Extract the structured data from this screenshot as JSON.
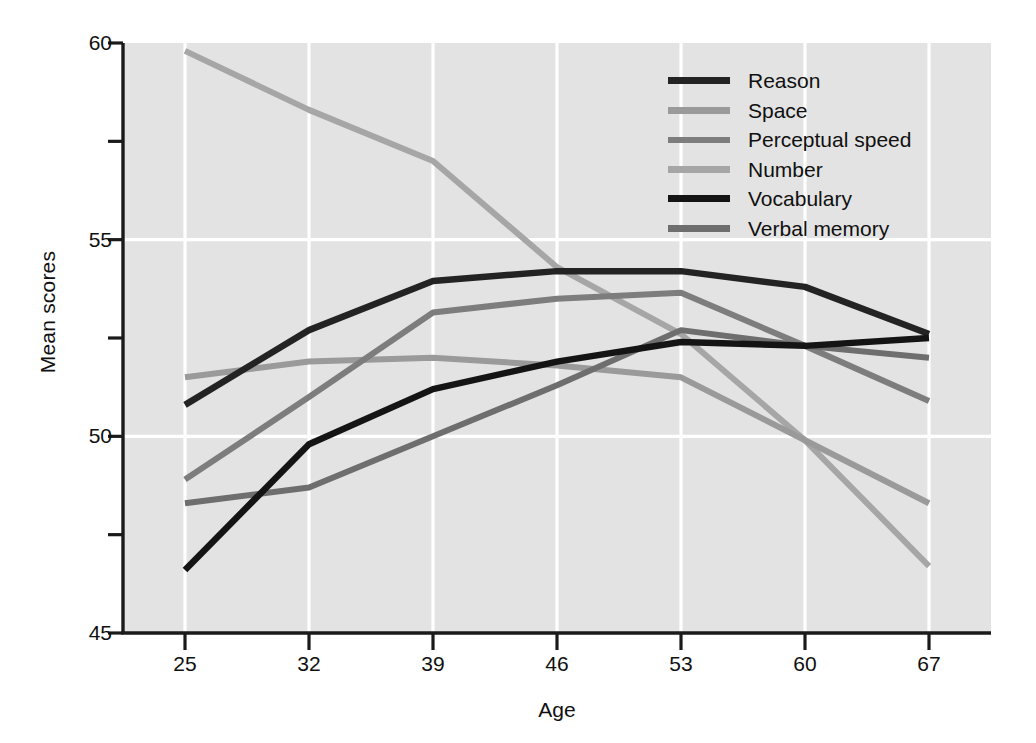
{
  "chart_data": {
    "type": "line",
    "title": "",
    "xlabel": "Age",
    "ylabel": "Mean scores",
    "x": [
      25,
      32,
      39,
      46,
      53,
      60,
      67
    ],
    "x_tick_labels": [
      "25",
      "32",
      "39",
      "46",
      "53",
      "60",
      "67"
    ],
    "y_tick_labels": [
      "60",
      "55",
      "50",
      "45"
    ],
    "y_major_ticks": [
      60,
      55,
      50,
      45
    ],
    "y_minor_ticks": [
      57.5,
      52.5,
      47.5
    ],
    "xlim": [
      21.5,
      70.5
    ],
    "ylim": [
      45,
      60
    ],
    "grid": "white gridlines on gray panel",
    "legend_position": "top-right inside plot",
    "panel_color": "#e3e3e3",
    "gridline_color": "#ffffff",
    "axis_color": "#1a1a1a",
    "series": [
      {
        "name": "Reason",
        "color": "#232323",
        "width": 6.5,
        "values": [
          50.8,
          52.7,
          53.95,
          54.2,
          54.2,
          53.8,
          52.6
        ]
      },
      {
        "name": "Space",
        "color": "#9a9a9a",
        "width": 6.0,
        "values": [
          51.5,
          51.9,
          52.0,
          51.8,
          51.5,
          49.9,
          48.3
        ]
      },
      {
        "name": "Perceptual speed",
        "color": "#7d7d7d",
        "width": 6.0,
        "values": [
          48.9,
          51.0,
          53.15,
          53.5,
          53.65,
          52.3,
          50.9
        ]
      },
      {
        "name": "Number",
        "color": "#a6a6a6",
        "width": 6.0,
        "values": [
          59.8,
          58.3,
          57.0,
          54.3,
          52.6,
          49.9,
          46.7
        ]
      },
      {
        "name": "Vocabulary",
        "color": "#141414",
        "width": 6.5,
        "values": [
          46.6,
          49.8,
          51.2,
          51.9,
          52.4,
          52.3,
          52.5
        ]
      },
      {
        "name": "Verbal memory",
        "color": "#6e6e6e",
        "width": 6.0,
        "values": [
          48.3,
          48.7,
          50.0,
          51.3,
          52.7,
          52.3,
          52.0
        ]
      }
    ]
  },
  "legend": {
    "entries": [
      {
        "label": "Reason"
      },
      {
        "label": "Space"
      },
      {
        "label": "Perceptual speed"
      },
      {
        "label": "Number"
      },
      {
        "label": "Vocabulary"
      },
      {
        "label": "Verbal memory"
      }
    ]
  }
}
